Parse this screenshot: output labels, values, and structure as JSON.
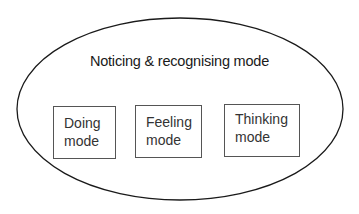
{
  "diagram": {
    "outer": {
      "label": "Noticing & recognising mode"
    },
    "boxes": [
      {
        "line1": "Doing",
        "line2": "mode"
      },
      {
        "line1": "Feeling",
        "line2": "mode"
      },
      {
        "line1": "Thinking",
        "line2": "mode"
      }
    ]
  }
}
